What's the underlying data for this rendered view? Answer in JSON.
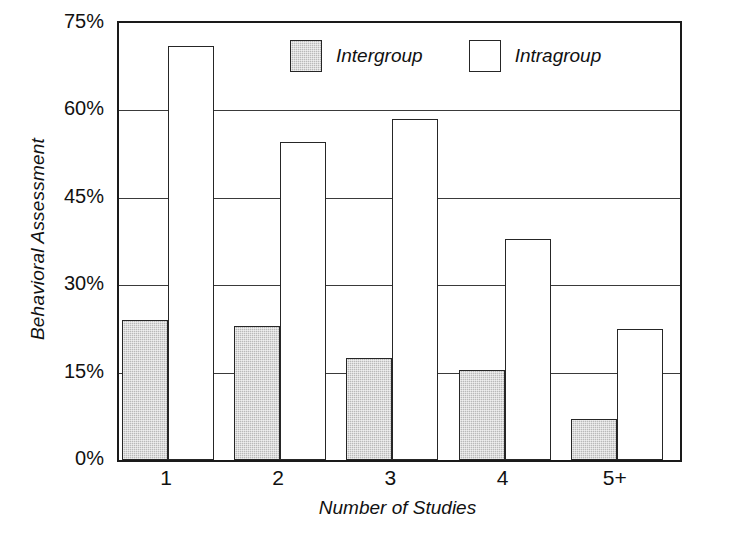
{
  "chart_data": {
    "type": "bar",
    "title": "",
    "xlabel": "Number of Studies",
    "ylabel": "Behavioral Assessment",
    "categories": [
      "1",
      "2",
      "3",
      "4",
      "5+"
    ],
    "series": [
      {
        "name": "Intergroup",
        "values": [
          24,
          23,
          17.5,
          15.5,
          7
        ],
        "color": "#b9b9b9"
      },
      {
        "name": "Intragroup",
        "values": [
          71,
          54.5,
          58.5,
          38,
          22.5
        ],
        "color": "#ffffff"
      }
    ],
    "ylim": [
      0,
      75
    ],
    "yticks": [
      0,
      15,
      30,
      45,
      60,
      75
    ],
    "ytick_labels": [
      "0%",
      "15%",
      "30%",
      "45%",
      "60%",
      "75%"
    ],
    "grid": true,
    "legend_position": "top-center"
  },
  "axes": {
    "y_title": "Behavioral Assessment",
    "x_title": "Number of Studies",
    "y_ticks": [
      {
        "label": "75%",
        "value": 75
      },
      {
        "label": "60%",
        "value": 60
      },
      {
        "label": "45%",
        "value": 45
      },
      {
        "label": "30%",
        "value": 30
      },
      {
        "label": "15%",
        "value": 15
      },
      {
        "label": "0%",
        "value": 0
      }
    ],
    "x_ticks": [
      {
        "label": "1"
      },
      {
        "label": "2"
      },
      {
        "label": "3"
      },
      {
        "label": "4"
      },
      {
        "label": "5+"
      }
    ]
  },
  "legend": {
    "items": [
      {
        "label": "Intergroup",
        "swatch": "gray-filled-swatch"
      },
      {
        "label": "Intragroup",
        "swatch": "white-open-swatch"
      }
    ]
  },
  "colors": {
    "intergroup_fill": "#b9b9b9",
    "intragroup_fill": "#ffffff",
    "outline": "#262626",
    "gridline": "#3a3a3a",
    "background": "#ffffff"
  }
}
